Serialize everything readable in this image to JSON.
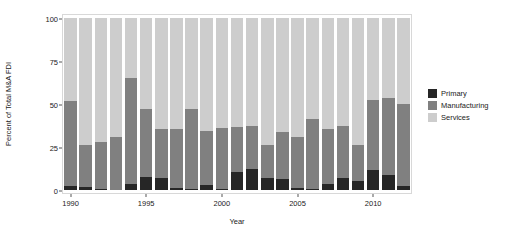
{
  "chart_data": {
    "type": "bar",
    "subtype": "stacked-percent",
    "title": "",
    "xlabel": "Year",
    "ylabel": "Percent of Total M&A FDI",
    "ylim": [
      0,
      100
    ],
    "yticks": [
      0,
      25,
      50,
      75,
      100
    ],
    "ytick_labels": [
      "0",
      "25",
      "50",
      "75",
      "100"
    ],
    "xticks": [
      1990,
      1995,
      2000,
      2005,
      2010
    ],
    "xtick_labels": [
      "1990",
      "1995",
      "2000",
      "2005",
      "2010"
    ],
    "grid": false,
    "legend_position": "right",
    "categories": [
      1990,
      1991,
      1992,
      1993,
      1994,
      1995,
      1996,
      1997,
      1998,
      1999,
      2000,
      2001,
      2002,
      2003,
      2004,
      2005,
      2006,
      2007,
      2008,
      2009,
      2010,
      2011,
      2012
    ],
    "series": [
      {
        "name": "Primary",
        "color": "#262626",
        "values": [
          2.5,
          2.0,
          0.7,
          0.0,
          3.5,
          7.5,
          7.0,
          1.0,
          0.5,
          3.0,
          0.5,
          10.5,
          12.0,
          7.0,
          6.5,
          1.0,
          0.5,
          3.5,
          7.0,
          5.5,
          11.5,
          8.5,
          2.5
        ]
      },
      {
        "name": "Manufacturing",
        "color": "#808080",
        "values": [
          49.5,
          24.0,
          27.3,
          31.0,
          61.5,
          39.5,
          28.5,
          34.5,
          46.5,
          31.5,
          35.5,
          26.0,
          25.0,
          19.0,
          27.5,
          30.0,
          40.5,
          32.0,
          30.5,
          20.5,
          41.0,
          45.0,
          47.5
        ]
      },
      {
        "name": "Services",
        "color": "#cdcdcd",
        "values": [
          48.0,
          74.0,
          72.0,
          69.0,
          35.0,
          53.0,
          64.5,
          64.5,
          53.0,
          65.5,
          64.0,
          63.5,
          63.0,
          74.0,
          66.0,
          69.0,
          59.0,
          64.5,
          62.5,
          74.0,
          47.5,
          46.5,
          50.0
        ]
      }
    ]
  },
  "legend": {
    "items": [
      {
        "label": "Primary",
        "color": "#262626"
      },
      {
        "label": "Manufacturing",
        "color": "#808080"
      },
      {
        "label": "Services",
        "color": "#cdcdcd"
      }
    ]
  }
}
